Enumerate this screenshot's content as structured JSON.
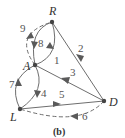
{
  "diagram": {
    "caption": "(b)",
    "nodes": [
      {
        "id": "R",
        "label": "R",
        "x": 52,
        "y": 22
      },
      {
        "id": "A",
        "label": "A",
        "x": 35,
        "y": 65
      },
      {
        "id": "D",
        "label": "D",
        "x": 104,
        "y": 101
      },
      {
        "id": "L",
        "label": "L",
        "x": 20,
        "y": 109
      }
    ],
    "edges": [
      {
        "id": 1,
        "label": "1",
        "from": "A",
        "to": "R",
        "style": "solid"
      },
      {
        "id": 2,
        "label": "2",
        "from": "R",
        "to": "D",
        "style": "solid"
      },
      {
        "id": 3,
        "label": "3",
        "from": "D",
        "to": "A",
        "style": "solid"
      },
      {
        "id": 4,
        "label": "4",
        "from": "A",
        "to": "L",
        "style": "solid"
      },
      {
        "id": 5,
        "label": "5",
        "from": "L",
        "to": "D",
        "style": "solid"
      },
      {
        "id": 6,
        "label": "6",
        "from": "D",
        "to": "L",
        "style": "dashed"
      },
      {
        "id": 7,
        "label": "7",
        "from": "L",
        "to": "A",
        "style": "solid"
      },
      {
        "id": 8,
        "label": "8",
        "from": "R",
        "to": "A",
        "style": "solid"
      },
      {
        "id": 9,
        "label": "9",
        "from": "A",
        "to": "R",
        "style": "dashed"
      }
    ]
  }
}
